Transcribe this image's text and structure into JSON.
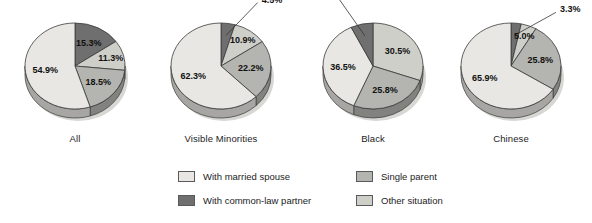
{
  "chart_data": {
    "type": "pie",
    "title": "",
    "legend_position": "bottom",
    "categories": [
      "With married spouse",
      "With common-law partner",
      "Single parent",
      "Other situation"
    ],
    "colors": {
      "with_married_spouse": "#e8e7e3",
      "with_common_law_partner": "#6f6f6f",
      "single_parent": "#b4b4b0",
      "other_situation": "#cfcfca",
      "edge": "#3a3a3a",
      "shadow": "#9a9a96",
      "text": "#111111"
    },
    "charts": [
      {
        "label": "All",
        "slices": [
          {
            "name": "With common-law partner",
            "value": 15.3,
            "display": "15.3%"
          },
          {
            "name": "Other situation",
            "value": 11.3,
            "display": "11.3%"
          },
          {
            "name": "Single parent",
            "value": 18.5,
            "display": "18.5%"
          },
          {
            "name": "With married spouse",
            "value": 54.9,
            "display": "54.9%"
          }
        ]
      },
      {
        "label": "Visible Minorities",
        "slices": [
          {
            "name": "With common-law partner",
            "value": 4.5,
            "display": "4.5%"
          },
          {
            "name": "Other situation",
            "value": 10.9,
            "display": "10.9%"
          },
          {
            "name": "Single parent",
            "value": 22.2,
            "display": "22.2%"
          },
          {
            "name": "With married spouse",
            "value": 62.3,
            "display": "62.3%"
          }
        ]
      },
      {
        "label": "Black",
        "slices": [
          {
            "name": "Other situation",
            "value": 30.5,
            "display": "30.5%"
          },
          {
            "name": "Single parent",
            "value": 25.8,
            "display": "25.8%"
          },
          {
            "name": "With married spouse",
            "value": 36.5,
            "display": "36.5%"
          },
          {
            "name": "With common-law partner",
            "value": 7.2,
            "display": "7.2%"
          }
        ]
      },
      {
        "label": "Chinese",
        "slices": [
          {
            "name": "With common-law partner",
            "value": 3.3,
            "display": "3.3%"
          },
          {
            "name": "Other situation",
            "value": 5.0,
            "display": "5.0%"
          },
          {
            "name": "Single parent",
            "value": 25.8,
            "display": "25.8%"
          },
          {
            "name": "With married spouse",
            "value": 65.9,
            "display": "65.9%"
          }
        ]
      }
    ]
  },
  "legend": {
    "items": [
      {
        "label": "With married spouse",
        "key": "with_married_spouse",
        "column": "left"
      },
      {
        "label": "With common-law partner",
        "key": "with_common_law_partner",
        "column": "left"
      },
      {
        "label": "Single parent",
        "key": "single_parent",
        "column": "right"
      },
      {
        "label": "Other situation",
        "key": "other_situation",
        "column": "right"
      }
    ]
  }
}
